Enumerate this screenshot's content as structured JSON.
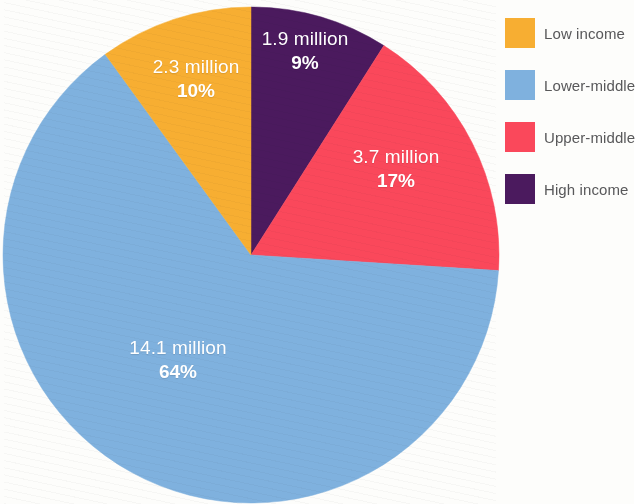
{
  "figure": {
    "background_color": "#fdfdfb"
  },
  "chart_data": {
    "type": "pie",
    "title": "",
    "subtitle": "",
    "xlabel": "",
    "ylabel": "",
    "units": "million",
    "total_label": "",
    "legend_position": "right",
    "grid": false,
    "start_angle_deg": 0,
    "direction": "clockwise",
    "categories": [
      "High income",
      "Upper-middle",
      "Lower-middle",
      "Low income"
    ],
    "values": [
      1.9,
      3.7,
      14.1,
      2.3
    ],
    "percentages": [
      9,
      17,
      64,
      10
    ],
    "colors": [
      "#4b1a5e",
      "#fa485b",
      "#7fb1de",
      "#f7ae32"
    ],
    "slices": [
      {
        "name": "High income",
        "value": 1.9,
        "value_label": "1.9 million",
        "percent": 9,
        "percent_label": "9%",
        "color": "#4b1a5e",
        "legend_label": "High income"
      },
      {
        "name": "Upper-middle",
        "value": 3.7,
        "value_label": "3.7 million",
        "percent": 17,
        "percent_label": "17%",
        "color": "#fa485b",
        "legend_label": "Upper-middle"
      },
      {
        "name": "Lower-middle",
        "value": 14.1,
        "value_label": "14.1 million",
        "percent": 64,
        "percent_label": "64%",
        "color": "#7fb1de",
        "legend_label": "Lower-middle"
      },
      {
        "name": "Low income",
        "value": 2.3,
        "value_label": "2.3 million",
        "percent": 10,
        "percent_label": "10%",
        "color": "#f7ae32",
        "legend_label": "Low income"
      }
    ]
  },
  "legend": {
    "items": [
      {
        "label": "Low income",
        "color": "#f7ae32",
        "swatch_name": "legend-swatch-low-income"
      },
      {
        "label": "Lower-middle",
        "color": "#7fb1de",
        "swatch_name": "legend-swatch-lower-middle"
      },
      {
        "label": "Upper-middle",
        "color": "#fa485b",
        "swatch_name": "legend-swatch-upper-middle"
      },
      {
        "label": "High income",
        "color": "#4b1a5e",
        "swatch_name": "legend-swatch-high-income"
      }
    ],
    "text_color": "#58585a"
  },
  "labels": {
    "high": {
      "value": "1.9 million",
      "percent": "9%"
    },
    "upper": {
      "value": "3.7 million",
      "percent": "17%"
    },
    "lower": {
      "value": "14.1 million",
      "percent": "64%"
    },
    "low": {
      "value": "2.3 million",
      "percent": "10%"
    }
  }
}
